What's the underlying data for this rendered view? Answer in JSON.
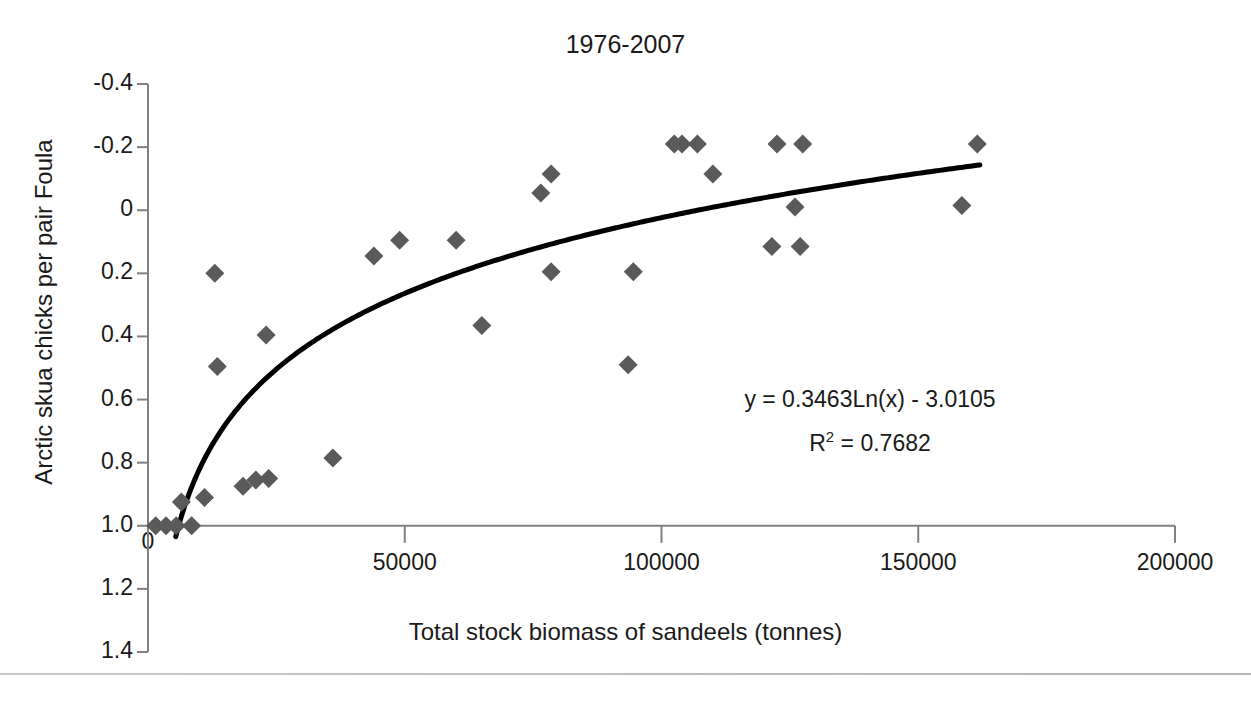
{
  "chart_data": {
    "type": "scatter",
    "title": "1976-2007",
    "xlabel": "Total stock biomass of sandeels (tonnes)",
    "ylabel": "Arctic skua chicks per pair Foula",
    "xlim": [
      0,
      200000
    ],
    "ylim": [
      -0.4,
      1.4
    ],
    "grid": false,
    "legend": "none",
    "xticks": [
      0,
      50000,
      100000,
      150000,
      200000
    ],
    "xtick_labels": [
      "0",
      "50000",
      "100000",
      "150000",
      "200000"
    ],
    "yticks": [
      -0.4,
      -0.2,
      0,
      0.2,
      0.4,
      0.6,
      0.8,
      1.0,
      1.2,
      1.4
    ],
    "ytick_labels": [
      "1.4",
      "1.2",
      "1.0",
      "0.8",
      "0.6",
      "0.4",
      "0.2",
      "0",
      "-0.2",
      "-0.4"
    ],
    "marker": "diamond",
    "marker_color": "#5a5a5a",
    "series": [
      {
        "name": "Arctic skua breeding success vs sandeel biomass",
        "points": [
          [
            1500,
            0.0
          ],
          [
            3500,
            0.0
          ],
          [
            5500,
            0.0
          ],
          [
            6500,
            0.075
          ],
          [
            8500,
            0.0
          ],
          [
            11000,
            0.09
          ],
          [
            13000,
            0.8
          ],
          [
            13500,
            0.505
          ],
          [
            18500,
            0.125
          ],
          [
            21000,
            0.145
          ],
          [
            23000,
            0.605
          ],
          [
            23500,
            0.15
          ],
          [
            36000,
            0.215
          ],
          [
            44000,
            0.855
          ],
          [
            49000,
            0.905
          ],
          [
            60000,
            0.905
          ],
          [
            65000,
            0.635
          ],
          [
            76500,
            1.055
          ],
          [
            78500,
            1.115
          ],
          [
            78500,
            0.805
          ],
          [
            93500,
            0.51
          ],
          [
            94500,
            0.805
          ],
          [
            102500,
            1.21
          ],
          [
            104000,
            1.21
          ],
          [
            107000,
            1.21
          ],
          [
            110000,
            1.115
          ],
          [
            121500,
            0.885
          ],
          [
            122500,
            1.21
          ],
          [
            127000,
            0.885
          ],
          [
            127500,
            1.21
          ],
          [
            126000,
            1.01
          ],
          [
            158500,
            1.015
          ],
          [
            161500,
            1.21
          ]
        ]
      }
    ],
    "trendline": {
      "type": "logarithmic",
      "equation": "y = 0.3463Ln(x) - 3.0105",
      "r_squared_label": "R",
      "r_squared_exponent": "2",
      "r_squared_value": " = 0.7682",
      "slope": 0.3463,
      "intercept": -3.0105,
      "r2": 0.7682,
      "color": "#000000",
      "width": 5,
      "x_start": 5400,
      "x_end": 162000
    },
    "annotations": [
      {
        "name": "equation-label",
        "text": "y = 0.3463Ln(x) - 3.0105"
      },
      {
        "name": "r-squared-label",
        "text": "R² = 0.7682"
      }
    ]
  },
  "axis_colors": {
    "axis_line": "#808080",
    "tick": "#808080",
    "text": "#1a1a1a"
  },
  "caption": {
    "ghost_text": ""
  }
}
